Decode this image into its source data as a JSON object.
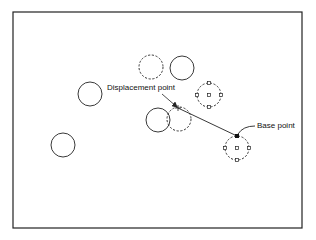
{
  "diagram": {
    "type": "cad-move-operation",
    "frame": {
      "x": 13,
      "y": 12,
      "width": 289,
      "height": 216,
      "stroke": "#222222"
    },
    "colors": {
      "stroke": "#222222",
      "background": "#ffffff"
    },
    "circles": [
      {
        "id": "circle-left-upper",
        "cx": 90,
        "cy": 94,
        "r": 12,
        "style": "solid"
      },
      {
        "id": "circle-left-lower",
        "cx": 63,
        "cy": 145,
        "r": 12,
        "style": "solid"
      },
      {
        "id": "circle-top-dashed",
        "cx": 151,
        "cy": 67,
        "r": 12,
        "style": "dashed"
      },
      {
        "id": "circle-top-solid",
        "cx": 182,
        "cy": 68,
        "r": 12,
        "style": "solid"
      },
      {
        "id": "circle-grips-upper",
        "cx": 209,
        "cy": 95,
        "r": 12,
        "style": "dashed",
        "grips": true
      },
      {
        "id": "circle-middle-solid",
        "cx": 158,
        "cy": 120,
        "r": 12,
        "style": "solid"
      },
      {
        "id": "circle-middle-dashed",
        "cx": 179,
        "cy": 119,
        "r": 12,
        "style": "dashed"
      },
      {
        "id": "circle-grips-lower",
        "cx": 237,
        "cy": 148,
        "r": 12,
        "style": "dashed",
        "grips": true
      }
    ],
    "displacement_line": {
      "x1": 178,
      "y1": 108,
      "x2": 237,
      "y2": 136
    },
    "displacement_point": {
      "x": 178,
      "y": 108,
      "label": "Displacement point",
      "label_x": 107,
      "label_y": 84
    },
    "displacement_leader": {
      "x1": 162,
      "y1": 94,
      "x2": 177,
      "y2": 107
    },
    "base_point": {
      "x": 237,
      "y": 136,
      "size": 4,
      "label": "Base point",
      "label_x": 257,
      "label_y": 122
    },
    "base_leader": {
      "path": "M 255 126 Q 243 126 238 134"
    }
  }
}
